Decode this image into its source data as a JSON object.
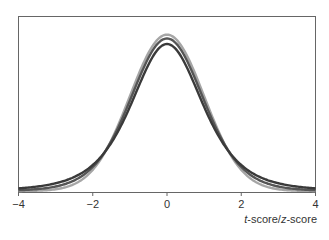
{
  "chart_data": {
    "type": "line",
    "title": "",
    "xlabel": "t-score/z-score",
    "xlabel_parts": {
      "a": "t",
      "b": "-score/",
      "c": "z",
      "d": "-score"
    },
    "ylabel": "",
    "xlim": [
      -4,
      4
    ],
    "ylim": [
      0,
      0.44
    ],
    "x_ticks": [
      "−4",
      "−2",
      "0",
      "2",
      "4"
    ],
    "grid": false,
    "legend": "none",
    "series": [
      {
        "name": "z (standard normal)",
        "color": "#a6a6a6",
        "df": null,
        "peak": 0.399
      },
      {
        "name": "t (larger df)",
        "color": "#555555",
        "df": 10,
        "peak": 0.389
      },
      {
        "name": "t (smaller df)",
        "color": "#3a3a3a",
        "df": 4,
        "peak": 0.375
      }
    ]
  }
}
